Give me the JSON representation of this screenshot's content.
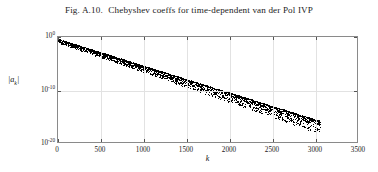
{
  "caption": {
    "figure_number": "Fig. A.10.",
    "text": "Chebyshev coeffs for time-dependent van der Pol IVP"
  },
  "chart_data": {
    "type": "scatter",
    "title": "Chebyshev coeffs for time-dependent van der Pol IVP",
    "xlabel": "k",
    "ylabel": "|a_k|",
    "yscale": "log",
    "xscale": "linear",
    "grid": true,
    "legend": null,
    "xlim": [
      0,
      3500
    ],
    "ylim": [
      1e-20,
      1.0
    ],
    "xticks": [
      0,
      500,
      1000,
      1500,
      2000,
      2500,
      3000,
      3500
    ],
    "xticklabels": [
      "0",
      "500",
      "1000",
      "1500",
      "2000",
      "2500",
      "3000",
      "3500"
    ],
    "yticks": [
      1.0,
      1e-10,
      1e-20
    ],
    "yticklabels": [
      "10",
      "10",
      "10"
    ],
    "yticklabel_exponents": [
      "0",
      "-10",
      "-20"
    ],
    "marker": "dot",
    "marker_color": "#000000",
    "series": [
      {
        "name": "|a_k|",
        "n_points": 3100,
        "k_start": 0,
        "k_end": 3070,
        "envelope_log10_start": -0.45,
        "envelope_log10_end": -16.1,
        "scatter_spread_decades": 1.9,
        "color": "#000000"
      }
    ],
    "sampled_points": [
      {
        "k": 0,
        "a": 0.35
      },
      {
        "k": 250,
        "a": 0.03
      },
      {
        "k": 500,
        "a": 0.0026
      },
      {
        "k": 750,
        "a": 0.00022
      },
      {
        "k": 1000,
        "a": 1.9e-05
      },
      {
        "k": 1250,
        "a": 1.6e-06
      },
      {
        "k": 1500,
        "a": 1.4e-07
      },
      {
        "k": 1750,
        "a": 1.2e-08
      },
      {
        "k": 2000,
        "a": 1e-09
      },
      {
        "k": 2250,
        "a": 8.7e-11
      },
      {
        "k": 2500,
        "a": 7.4e-12
      },
      {
        "k": 2750,
        "a": 6.4e-13
      },
      {
        "k": 2950,
        "a": 1.2e-14
      },
      {
        "k": 3050,
        "a": 8e-17
      }
    ]
  },
  "axis": {
    "y_base": "10",
    "x_axis_title": "k",
    "y_axis_title_base": "a",
    "y_axis_title_sub": "k"
  }
}
